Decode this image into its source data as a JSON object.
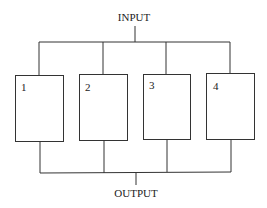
{
  "diagram": {
    "type": "parallel-block-diagram",
    "input_label": "INPUT",
    "output_label": "OUTPUT",
    "blocks": [
      {
        "label": "1"
      },
      {
        "label": "2"
      },
      {
        "label": "3"
      },
      {
        "label": "4"
      }
    ],
    "colors": {
      "line": "#333333",
      "text": "#222222",
      "background": "#ffffff"
    }
  }
}
